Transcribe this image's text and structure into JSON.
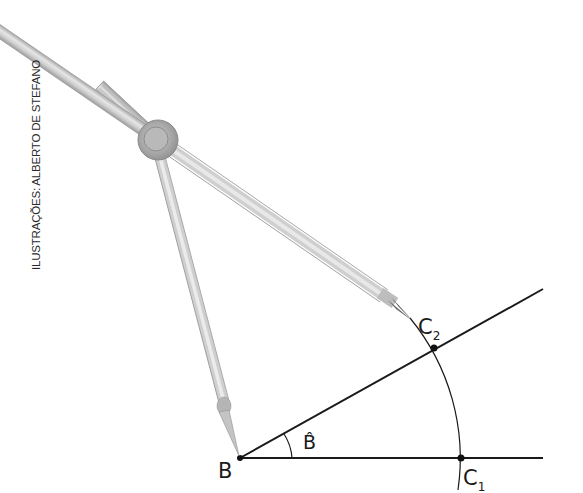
{
  "credit": "ILUSTRAÇÕES: ALBERTO DE STEFANO",
  "labels": {
    "vertex": "B",
    "angle": "B̂",
    "point1_main": "C",
    "point1_sub": "1",
    "point2_main": "C",
    "point2_sub": "2"
  },
  "colors": {
    "line": "#1a1a1a",
    "compass_metal": "#c9c9c9",
    "compass_shadow": "#9a9a9a",
    "background": "#ffffff"
  },
  "geometry": {
    "vertex_B": [
      240,
      458
    ],
    "point_C1": [
      461,
      458
    ],
    "point_C2": [
      434,
      348
    ],
    "arc_radius": 221
  }
}
